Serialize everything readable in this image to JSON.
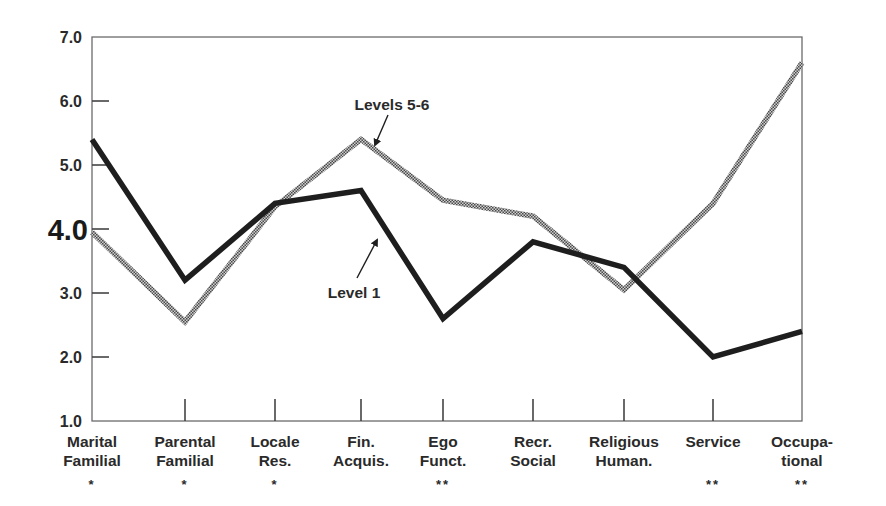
{
  "chart_data": {
    "type": "line",
    "title": "",
    "xlabel": "",
    "ylabel": "",
    "ylim": [
      1.0,
      7.0
    ],
    "yticks": [
      "1.0",
      "2.0",
      "3.0",
      "4.0",
      "5.0",
      "6.0",
      "7.0"
    ],
    "emphasized_ytick": "4.0",
    "grid": false,
    "legend": "inline annotations with arrows",
    "categories": [
      {
        "line1": "Marital",
        "line2": "Familial",
        "marker": "*"
      },
      {
        "line1": "Parental",
        "line2": "Familial",
        "marker": "*"
      },
      {
        "line1": "Locale",
        "line2": "Res.",
        "marker": "*"
      },
      {
        "line1": "Fin.",
        "line2": "Acquis.",
        "marker": ""
      },
      {
        "line1": "Ego",
        "line2": "Funct.",
        "marker": "**"
      },
      {
        "line1": "Recr.",
        "line2": "Social",
        "marker": ""
      },
      {
        "line1": "Religious",
        "line2": "Human.",
        "marker": ""
      },
      {
        "line1": "Service",
        "line2": "",
        "marker": "**"
      },
      {
        "line1": "Occupa-",
        "line2": "tional",
        "marker": "**"
      }
    ],
    "series": [
      {
        "name": "Level 1",
        "style": "solid-black",
        "color": "#1e1e1e",
        "values": [
          5.4,
          3.2,
          4.4,
          4.6,
          2.6,
          3.8,
          3.4,
          2.0,
          2.4
        ]
      },
      {
        "name": "Levels 5-6",
        "style": "hatched-gray",
        "color": "#8a8a8a",
        "values": [
          3.95,
          2.55,
          4.35,
          5.4,
          4.45,
          4.2,
          3.05,
          4.4,
          6.6
        ]
      }
    ],
    "annotations": [
      {
        "text": "Levels 5-6",
        "series": "Levels 5-6"
      },
      {
        "text": "Level 1",
        "series": "Level 1"
      }
    ]
  }
}
